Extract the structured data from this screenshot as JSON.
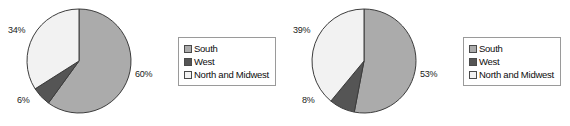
{
  "colors": {
    "south": "#ababab",
    "west": "#555555",
    "north_and_midwest": "#f2f2f2",
    "slice_outline": "#3c3c3c",
    "legend_border": "#9a9a9a",
    "text": "#1a1a1a",
    "background": "#ffffff"
  },
  "legend": {
    "items": [
      {
        "label": "South",
        "color_key": "south"
      },
      {
        "label": "West",
        "color_key": "west"
      },
      {
        "label": "North and Midwest",
        "color_key": "north_and_midwest"
      }
    ]
  },
  "charts": [
    {
      "id": "chart-left",
      "labels": {
        "south": "60%",
        "west": "6%",
        "north_and_midwest": "34%"
      }
    },
    {
      "id": "chart-right",
      "labels": {
        "south": "53%",
        "west": "8%",
        "north_and_midwest": "39%"
      }
    }
  ],
  "chart_data": [
    {
      "type": "pie",
      "title": "",
      "categories": [
        "South",
        "West",
        "North and Midwest"
      ],
      "values": [
        60,
        6,
        34
      ],
      "value_labels": [
        "60%",
        "6%",
        "34%"
      ],
      "units": "percent",
      "start_angle_deg": 0,
      "direction": "clockwise",
      "legend": {
        "position": "right",
        "entries": [
          "South",
          "West",
          "North and Midwest"
        ]
      },
      "colors": [
        "#ababab",
        "#555555",
        "#f2f2f2"
      ],
      "grid": false
    },
    {
      "type": "pie",
      "title": "",
      "categories": [
        "South",
        "West",
        "North and Midwest"
      ],
      "values": [
        53,
        8,
        39
      ],
      "value_labels": [
        "53%",
        "8%",
        "39%"
      ],
      "units": "percent",
      "start_angle_deg": 0,
      "direction": "clockwise",
      "legend": {
        "position": "right",
        "entries": [
          "South",
          "West",
          "North and Midwest"
        ]
      },
      "colors": [
        "#ababab",
        "#555555",
        "#f2f2f2"
      ],
      "grid": false
    }
  ]
}
